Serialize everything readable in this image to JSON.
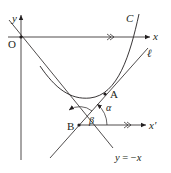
{
  "diagram": {
    "type": "geometry-figure",
    "labels": {
      "origin": "O",
      "x_axis": "x",
      "y_axis": "y",
      "curve": "C",
      "tangent_line": "ℓ",
      "point_a": "A",
      "point_b": "B",
      "x_prime_axis": "x′",
      "asymptote": "y = −x",
      "angle_alpha": "α",
      "angle_beta": "β"
    },
    "colors": {
      "stroke": "#231f20",
      "background": "#ffffff"
    }
  }
}
